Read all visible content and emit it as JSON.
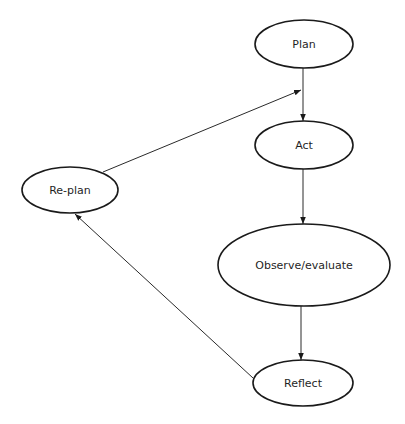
{
  "diagram": {
    "type": "cycle-flowchart",
    "colors": {
      "background": "#ffffff",
      "stroke": "#1a1a1a",
      "text": "#1f1f1f"
    },
    "nodes": [
      {
        "id": "plan",
        "label": "Plan",
        "shape": "ellipse",
        "cx": 304,
        "cy": 44,
        "rx": 49,
        "ry": 24
      },
      {
        "id": "act",
        "label": "Act",
        "shape": "ellipse",
        "cx": 304,
        "cy": 145,
        "rx": 49,
        "ry": 24
      },
      {
        "id": "observe",
        "label": "Observe/evaluate",
        "shape": "ellipse",
        "cx": 304,
        "cy": 265,
        "rx": 86,
        "ry": 41
      },
      {
        "id": "reflect",
        "label": "Reflect",
        "shape": "ellipse",
        "cx": 303,
        "cy": 383,
        "rx": 50,
        "ry": 23
      },
      {
        "id": "replan",
        "label": "Re-plan",
        "shape": "ellipse",
        "cx": 70,
        "cy": 190,
        "rx": 48,
        "ry": 23
      }
    ],
    "edges": [
      {
        "from": "plan",
        "to": "act",
        "x1": 303,
        "y1": 68,
        "x2": 303,
        "y2": 121
      },
      {
        "from": "act",
        "to": "observe",
        "x1": 303,
        "y1": 169,
        "x2": 303,
        "y2": 224
      },
      {
        "from": "observe",
        "to": "reflect",
        "x1": 301,
        "y1": 306,
        "x2": 301,
        "y2": 360
      },
      {
        "from": "reflect",
        "to": "replan",
        "x1": 253,
        "y1": 378,
        "x2": 75,
        "y2": 214
      },
      {
        "from": "replan",
        "to": "plan-act-edge",
        "x1": 103,
        "y1": 172,
        "x2": 301,
        "y2": 90
      }
    ]
  }
}
